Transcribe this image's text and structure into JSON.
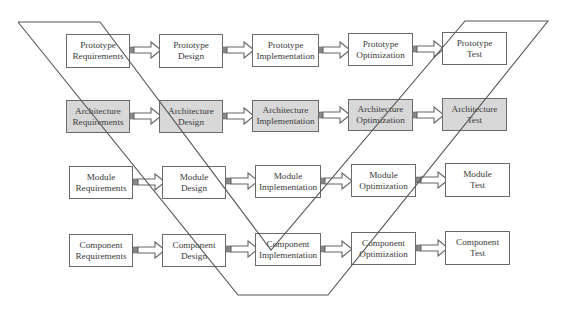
{
  "diagram": {
    "type": "process-flow-matrix",
    "rows": [
      {
        "name": "Prototype",
        "shaded": false,
        "stages": [
          {
            "line1": "Prototype",
            "line2": "Requirements"
          },
          {
            "line1": "Prototype",
            "line2": "Design"
          },
          {
            "line1": "Prototype",
            "line2": "Implementation"
          },
          {
            "line1": "Prototype",
            "line2": "Optimization"
          },
          {
            "line1": "Prototype",
            "line2": "Test"
          }
        ]
      },
      {
        "name": "Architecture",
        "shaded": true,
        "stages": [
          {
            "line1": "Architecture",
            "line2": "Requirements"
          },
          {
            "line1": "Architecture",
            "line2": "Design"
          },
          {
            "line1": "Architecture",
            "line2": "Implementation"
          },
          {
            "line1": "Architecture",
            "line2": "Optimization"
          },
          {
            "line1": "Architecture",
            "line2": "Test"
          }
        ]
      },
      {
        "name": "Module",
        "shaded": false,
        "stages": [
          {
            "line1": "Module",
            "line2": "Requirements"
          },
          {
            "line1": "Module",
            "line2": "Design"
          },
          {
            "line1": "Module",
            "line2": "Implementation"
          },
          {
            "line1": "Module",
            "line2": "Optimization"
          },
          {
            "line1": "Module",
            "line2": "Test"
          }
        ]
      },
      {
        "name": "Component",
        "shaded": false,
        "stages": [
          {
            "line1": "Component",
            "line2": "Requirements"
          },
          {
            "line1": "Component",
            "line2": "Design"
          },
          {
            "line1": "Component",
            "line2": "Implementation"
          },
          {
            "line1": "Component",
            "line2": "Optimization"
          },
          {
            "line1": "Component",
            "line2": "Test"
          }
        ]
      }
    ],
    "overlay": "V-shape band",
    "colors": {
      "box_border": "#6a6a6a",
      "box_fill": "#ffffff",
      "shaded_fill": "#d8d8d8",
      "line": "#555555",
      "text": "#3a3a3a"
    }
  }
}
